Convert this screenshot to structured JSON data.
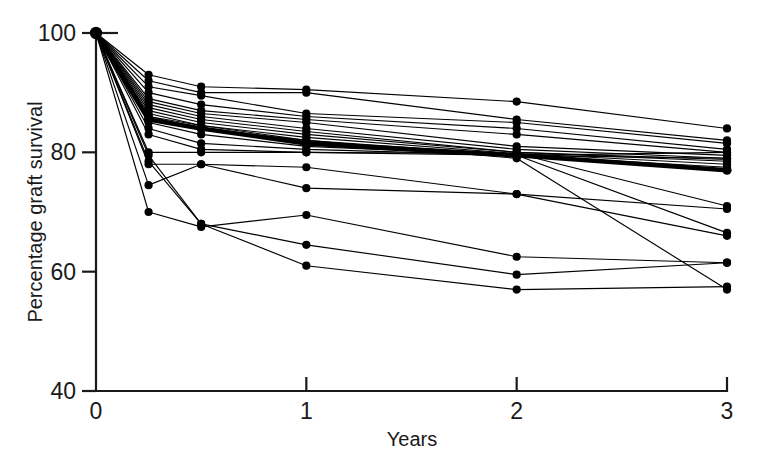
{
  "chart_data": {
    "type": "line",
    "title": "",
    "xlabel": "Years",
    "ylabel": "Percentage graft survival",
    "xlim": [
      0,
      3
    ],
    "ylim": [
      40,
      100
    ],
    "xticks": [
      0,
      1,
      2,
      3
    ],
    "xtick_labels": [
      "0",
      "1",
      "2",
      "3"
    ],
    "yticks": [
      40,
      60,
      80,
      100
    ],
    "ytick_labels": [
      "40",
      "60",
      "80",
      "100"
    ],
    "grid": false,
    "legend": "none",
    "marker": "filled-circle",
    "x": [
      0,
      0.25,
      0.5,
      1,
      2,
      3
    ],
    "series": [
      {
        "name": "centre-01",
        "values": [
          100,
          93.0,
          91.0,
          90.5,
          88.5,
          84.0
        ],
        "emphasis": false
      },
      {
        "name": "centre-02",
        "values": [
          100,
          92.0,
          90.0,
          90.0,
          85.5,
          82.0
        ],
        "emphasis": false
      },
      {
        "name": "centre-03",
        "values": [
          100,
          91.0,
          89.5,
          86.5,
          85.0,
          81.5
        ],
        "emphasis": false
      },
      {
        "name": "centre-04",
        "values": [
          100,
          90.0,
          88.0,
          86.0,
          84.0,
          80.5
        ],
        "emphasis": false
      },
      {
        "name": "centre-05",
        "values": [
          100,
          89.0,
          87.0,
          85.5,
          83.0,
          80.0
        ],
        "emphasis": false
      },
      {
        "name": "centre-06",
        "values": [
          100,
          88.5,
          86.5,
          85.0,
          81.0,
          79.5
        ],
        "emphasis": false
      },
      {
        "name": "centre-07",
        "values": [
          100,
          88.0,
          86.0,
          84.0,
          80.5,
          79.0
        ],
        "emphasis": false
      },
      {
        "name": "centre-08",
        "values": [
          100,
          87.5,
          85.5,
          83.5,
          80.0,
          78.8
        ],
        "emphasis": false
      },
      {
        "name": "centre-09",
        "values": [
          100,
          87.0,
          85.0,
          83.0,
          80.0,
          78.5
        ],
        "emphasis": false
      },
      {
        "name": "centre-10",
        "values": [
          100,
          86.5,
          84.5,
          82.5,
          79.8,
          78.0
        ],
        "emphasis": false
      },
      {
        "name": "centre-11",
        "values": [
          100,
          86.0,
          84.0,
          82.0,
          79.5,
          77.5
        ],
        "emphasis": false
      },
      {
        "name": "overall",
        "values": [
          100,
          85.5,
          84.0,
          81.5,
          79.5,
          77.0
        ],
        "emphasis": true
      },
      {
        "name": "centre-12",
        "values": [
          100,
          85.0,
          83.0,
          81.0,
          79.5,
          80.0
        ],
        "emphasis": false
      },
      {
        "name": "centre-13",
        "values": [
          100,
          84.0,
          81.5,
          80.5,
          79.5,
          79.0
        ],
        "emphasis": false
      },
      {
        "name": "centre-14",
        "values": [
          100,
          83.0,
          80.5,
          80.0,
          79.5,
          66.5
        ],
        "emphasis": false
      },
      {
        "name": "centre-15",
        "values": [
          100,
          80.0,
          80.0,
          80.0,
          79.8,
          71.0
        ],
        "emphasis": false
      },
      {
        "name": "centre-16",
        "values": [
          100,
          78.0,
          78.0,
          77.5,
          73.0,
          66.0
        ],
        "emphasis": false
      },
      {
        "name": "centre-17",
        "values": [
          100,
          74.5,
          78.0,
          74.0,
          73.0,
          70.5
        ],
        "emphasis": false
      },
      {
        "name": "centre-18",
        "values": [
          100,
          70.0,
          67.5,
          69.5,
          62.5,
          61.5
        ],
        "emphasis": false
      },
      {
        "name": "centre-19",
        "values": [
          100,
          78.5,
          68.0,
          64.5,
          59.5,
          61.5
        ],
        "emphasis": false
      },
      {
        "name": "centre-20",
        "values": [
          100,
          79.5,
          68.0,
          61.0,
          57.0,
          57.5
        ],
        "emphasis": false
      },
      {
        "name": "centre-21",
        "values": [
          100,
          86.0,
          84.5,
          82.0,
          79.0,
          57.0
        ],
        "emphasis": false
      }
    ]
  },
  "axes": {
    "x_title": "Years",
    "y_title": "Percentage graft survival"
  }
}
